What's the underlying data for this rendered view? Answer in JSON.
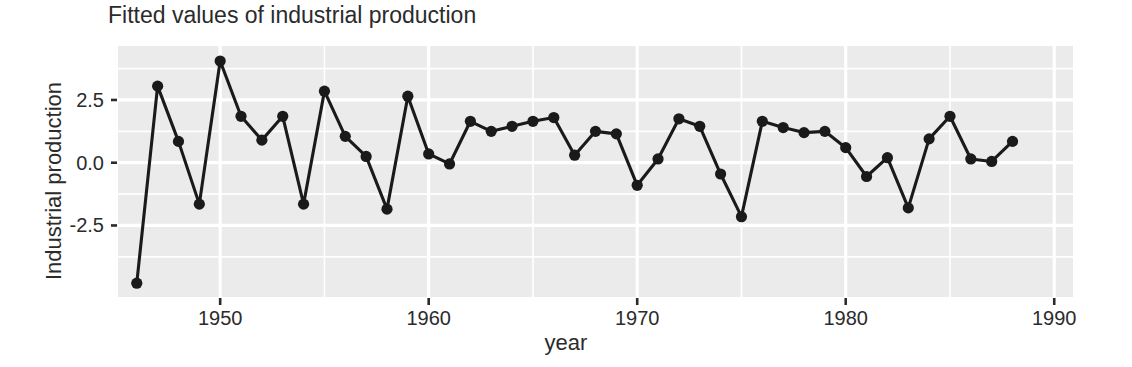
{
  "chart_data": {
    "type": "line",
    "title": "Fitted values of industrial production",
    "xlabel": "year",
    "ylabel": "Industrial production",
    "grid": true,
    "legend": "none",
    "marker": "filled-circle",
    "line_color": "#1a1a1a",
    "panel_background": "#ebebeb",
    "gridline_color": "#ffffff",
    "xlim": [
      1945.1,
      1990.9
    ],
    "ylim": [
      -5.35,
      4.65
    ],
    "x_ticks": [
      1950,
      1960,
      1970,
      1980,
      1990
    ],
    "x_tick_labels": [
      "1950",
      "1960",
      "1970",
      "1980",
      "1990"
    ],
    "y_ticks": [
      2.5,
      0.0,
      -2.5
    ],
    "y_tick_labels": [
      "2.5",
      "0.0",
      "-2.5"
    ],
    "y_minor_gridlines": [
      3.75,
      1.25,
      -1.25,
      -3.75
    ],
    "x_minor_gridlines": [
      1945,
      1955,
      1965,
      1975,
      1985
    ],
    "x": [
      1946,
      1947,
      1948,
      1949,
      1950,
      1951,
      1952,
      1953,
      1954,
      1955,
      1956,
      1957,
      1958,
      1959,
      1960,
      1961,
      1962,
      1963,
      1964,
      1965,
      1966,
      1967,
      1968,
      1969,
      1970,
      1971,
      1972,
      1973,
      1974,
      1975,
      1976,
      1977,
      1978,
      1979,
      1980,
      1981,
      1982,
      1983,
      1984,
      1985,
      1986,
      1987,
      1988
    ],
    "values": [
      -4.8,
      3.05,
      0.85,
      -1.65,
      4.05,
      1.85,
      0.9,
      1.85,
      -1.65,
      2.85,
      1.05,
      0.25,
      -1.85,
      2.65,
      0.35,
      -0.05,
      1.65,
      1.25,
      1.45,
      1.65,
      1.8,
      0.3,
      1.25,
      1.15,
      -0.9,
      0.15,
      1.75,
      1.45,
      -0.45,
      -2.15,
      1.65,
      1.4,
      1.2,
      1.25,
      0.6,
      -0.55,
      0.2,
      -1.8,
      0.95,
      1.85,
      0.15,
      0.05,
      0.85
    ],
    "series_name": "Fitted industrial production"
  },
  "axes": {
    "y_label": "Industrial production",
    "x_label": "year"
  }
}
